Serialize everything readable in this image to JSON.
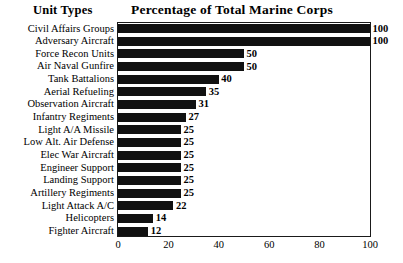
{
  "headings": {
    "left_column": "Unit Types",
    "title": "Percentage of Total Marine Corps"
  },
  "chart_data": {
    "type": "bar",
    "orientation": "horizontal",
    "title": "Percentage of Total Marine Corps",
    "xlabel": "",
    "ylabel": "Unit Types",
    "xlim": [
      0,
      100
    ],
    "grid": false,
    "legend": null,
    "bar_color": "#111111",
    "categories": [
      "Civil Affairs Groups",
      "Adversary Aircraft",
      "Force Recon Units",
      "Air Naval Gunfire",
      "Tank Battalions",
      "Aerial Refueling",
      "Observation Aircraft",
      "Infantry Regiments",
      "Light A/A Missile",
      "Low Alt. Air Defense",
      "Elec War Aircraft",
      "Engineer Support",
      "Landing Support",
      "Artillery Regiments",
      "Light Attack A/C",
      "Helicopters",
      "Fighter Aircraft"
    ],
    "values": [
      100,
      100,
      50,
      50,
      40,
      35,
      31,
      27,
      25,
      25,
      25,
      25,
      25,
      25,
      22,
      14,
      12
    ],
    "value_labels": [
      "100",
      "100",
      "50",
      "50",
      "40",
      "35",
      "31",
      "27",
      "25",
      "25",
      "25",
      "25",
      "25",
      "25",
      "22",
      "14",
      "12"
    ],
    "xticks": [
      0,
      20,
      40,
      60,
      80,
      100
    ],
    "xtick_labels": [
      "0",
      "20",
      "40",
      "60",
      "80",
      "100"
    ]
  }
}
